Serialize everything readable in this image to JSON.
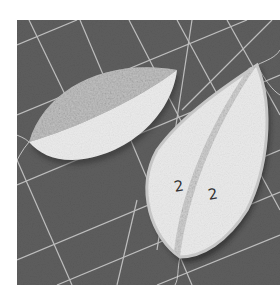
{
  "photo": {
    "subject": "Two fabric leaf shapes on a gray cutting mat",
    "colors": {
      "mat": "#5e5e5e",
      "grid_line": "#cfcfcf",
      "fabric_light": "#ececec",
      "fabric_speckled": "#bdbdbd",
      "seam_strip": "#d6d6d6",
      "thread": "#e4e4e4"
    },
    "labels": {
      "left_half_mark": "2",
      "right_half_mark": "2"
    }
  }
}
